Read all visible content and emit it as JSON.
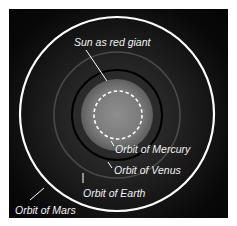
{
  "diagram": {
    "labels": {
      "sun": "Sun as red giant",
      "mercury": "Orbit of Mercury",
      "venus": "Orbit of Venus",
      "earth": "Orbit of Earth",
      "mars": "Orbit of Mars"
    },
    "colors": {
      "background": "#0a0a0a",
      "sun_outer": "#6e6e6e",
      "sun_inner": "#8a8a8a",
      "mercury_orbit": "#ffffff",
      "venus_orbit": "#000000",
      "earth_orbit": "#4a4a4a",
      "mars_orbit": "#ffffff",
      "text": "#f2f2f2"
    }
  }
}
